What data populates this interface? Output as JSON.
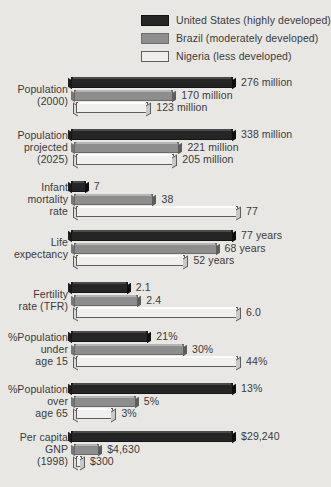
{
  "legend": {
    "items": [
      {
        "key": "us",
        "label": "United States (highly developed)",
        "color": "#252525"
      },
      {
        "key": "br",
        "label": "Brazil (moderately developed)",
        "color": "#8d8d8d"
      },
      {
        "key": "ng",
        "label": "Nigeria (less developed)",
        "color": "#f0efed"
      }
    ]
  },
  "chart_data": {
    "type": "bar",
    "orientation": "horizontal",
    "title": "",
    "xlabel": "",
    "ylabel": "",
    "grid": false,
    "legend_position": "top-right",
    "note": "Each category row is scaled independently to its own maximum value.",
    "categories": [
      "Population (2000)",
      "Population projected (2025)",
      "Infant mortality rate",
      "Life expectancy",
      "Fertility rate (TFR)",
      "%Population under age 15",
      "%Population over age 65",
      "Per capita GNP (1998)"
    ],
    "series": [
      {
        "name": "United States (highly developed)",
        "values": [
          276,
          338,
          7,
          77,
          2.1,
          21,
          13,
          29240
        ]
      },
      {
        "name": "Brazil (moderately developed)",
        "values": [
          170,
          221,
          38,
          68,
          2.4,
          30,
          5,
          4630
        ]
      },
      {
        "name": "Nigeria (less developed)",
        "values": [
          123,
          205,
          77,
          52,
          6.0,
          44,
          3,
          300
        ]
      }
    ],
    "groups": [
      {
        "label_lines": [
          "Population",
          "(2000)"
        ],
        "max": 276,
        "bars": [
          {
            "series": "us",
            "value": 276,
            "value_label": "276 million"
          },
          {
            "series": "br",
            "value": 170,
            "value_label": "170 million"
          },
          {
            "series": "ng",
            "value": 123,
            "value_label": "123 million"
          }
        ]
      },
      {
        "label_lines": [
          "Population",
          "projected",
          "(2025)"
        ],
        "max": 338,
        "bars": [
          {
            "series": "us",
            "value": 338,
            "value_label": "338 million"
          },
          {
            "series": "br",
            "value": 221,
            "value_label": "221 million"
          },
          {
            "series": "ng",
            "value": 205,
            "value_label": "205 million"
          }
        ]
      },
      {
        "label_lines": [
          "Infant",
          "mortality",
          "rate"
        ],
        "max": 77,
        "bars": [
          {
            "series": "us",
            "value": 7,
            "value_label": "7"
          },
          {
            "series": "br",
            "value": 38,
            "value_label": "38"
          },
          {
            "series": "ng",
            "value": 77,
            "value_label": "77"
          }
        ]
      },
      {
        "label_lines": [
          "Life",
          "expectancy"
        ],
        "max": 77,
        "bars": [
          {
            "series": "us",
            "value": 77,
            "value_label": "77 years"
          },
          {
            "series": "br",
            "value": 68,
            "value_label": "68 years"
          },
          {
            "series": "ng",
            "value": 52,
            "value_label": "52 years"
          }
        ]
      },
      {
        "label_lines": [
          "Fertility",
          "rate (TFR)"
        ],
        "max": 6.0,
        "bars": [
          {
            "series": "us",
            "value": 2.1,
            "value_label": "2.1"
          },
          {
            "series": "br",
            "value": 2.4,
            "value_label": "2.4"
          },
          {
            "series": "ng",
            "value": 6.0,
            "value_label": "6.0"
          }
        ]
      },
      {
        "label_lines": [
          "%Population",
          "under",
          "age 15"
        ],
        "max": 44,
        "bars": [
          {
            "series": "us",
            "value": 21,
            "value_label": "21%"
          },
          {
            "series": "br",
            "value": 30,
            "value_label": "30%"
          },
          {
            "series": "ng",
            "value": 44,
            "value_label": "44%"
          }
        ]
      },
      {
        "label_lines": [
          "%Population",
          "over",
          "age 65"
        ],
        "max": 13,
        "bars": [
          {
            "series": "us",
            "value": 13,
            "value_label": "13%"
          },
          {
            "series": "br",
            "value": 5,
            "value_label": "5%"
          },
          {
            "series": "ng",
            "value": 3,
            "value_label": "3%"
          }
        ]
      },
      {
        "label_lines": [
          "Per capita",
          "GNP",
          "(1998)"
        ],
        "max": 29240,
        "bars": [
          {
            "series": "us",
            "value": 29240,
            "value_label": "$29,240"
          },
          {
            "series": "br",
            "value": 4630,
            "value_label": "$4,630"
          },
          {
            "series": "ng",
            "value": 300,
            "value_label": "$300"
          }
        ]
      }
    ]
  }
}
